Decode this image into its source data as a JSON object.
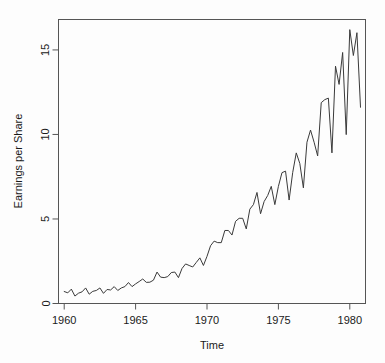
{
  "figure": {
    "background_color": "#fdfdfd",
    "frame_color": "#555555",
    "line_color": "#3a3a3a",
    "text_color": "#1a1a1a",
    "title_text": ""
  },
  "axis_labels": {
    "x": "Time",
    "y": "Earnings per Share"
  },
  "ticks": {
    "x": [
      "1960",
      "1965",
      "1970",
      "1975",
      "1980"
    ],
    "y": [
      "0",
      "5",
      "10",
      "15"
    ]
  },
  "chart_data": {
    "type": "line",
    "title": "",
    "xlabel": "Time",
    "ylabel": "Earnings per Share",
    "xlim": [
      1959.6,
      1981.1
    ],
    "ylim": [
      0.0,
      16.8
    ],
    "xticks": [
      1960,
      1965,
      1970,
      1975,
      1980
    ],
    "yticks": [
      0,
      5,
      10,
      15
    ],
    "grid": false,
    "legend": null,
    "frequency": "quarterly",
    "x": [
      1960.0,
      1960.25,
      1960.5,
      1960.75,
      1961.0,
      1961.25,
      1961.5,
      1961.75,
      1962.0,
      1962.25,
      1962.5,
      1962.75,
      1963.0,
      1963.25,
      1963.5,
      1963.75,
      1964.0,
      1964.25,
      1964.5,
      1964.75,
      1965.0,
      1965.25,
      1965.5,
      1965.75,
      1966.0,
      1966.25,
      1966.5,
      1966.75,
      1967.0,
      1967.25,
      1967.5,
      1967.75,
      1968.0,
      1968.25,
      1968.5,
      1968.75,
      1969.0,
      1969.25,
      1969.5,
      1969.75,
      1970.0,
      1970.25,
      1970.5,
      1970.75,
      1971.0,
      1971.25,
      1971.5,
      1971.75,
      1972.0,
      1972.25,
      1972.5,
      1972.75,
      1973.0,
      1973.25,
      1973.5,
      1973.75,
      1974.0,
      1974.25,
      1974.5,
      1974.75,
      1975.0,
      1975.25,
      1975.5,
      1975.75,
      1976.0,
      1976.25,
      1976.5,
      1976.75,
      1977.0,
      1977.25,
      1977.5,
      1977.75,
      1978.0,
      1978.25,
      1978.5,
      1978.75,
      1979.0,
      1979.25,
      1979.5,
      1979.75,
      1980.0,
      1980.25,
      1980.5,
      1980.75
    ],
    "values": [
      0.71,
      0.63,
      0.85,
      0.44,
      0.61,
      0.69,
      0.92,
      0.55,
      0.72,
      0.77,
      0.92,
      0.6,
      0.83,
      0.8,
      1.0,
      0.77,
      0.92,
      1.0,
      1.24,
      1.0,
      1.16,
      1.3,
      1.45,
      1.25,
      1.26,
      1.38,
      1.86,
      1.56,
      1.53,
      1.59,
      1.83,
      1.86,
      1.53,
      2.07,
      2.34,
      2.25,
      2.16,
      2.43,
      2.7,
      2.25,
      2.79,
      3.42,
      3.69,
      3.6,
      3.6,
      4.32,
      4.32,
      4.05,
      4.86,
      5.04,
      5.04,
      4.41,
      5.58,
      5.85,
      6.57,
      5.31,
      6.03,
      6.39,
      6.93,
      5.85,
      6.93,
      7.74,
      7.83,
      6.12,
      7.74,
      8.91,
      8.28,
      6.84,
      9.54,
      10.26,
      9.54,
      8.73,
      11.88,
      12.06,
      12.15,
      8.91,
      14.04,
      12.96,
      14.85,
      9.99,
      16.2,
      14.67,
      16.02,
      11.61
    ]
  }
}
